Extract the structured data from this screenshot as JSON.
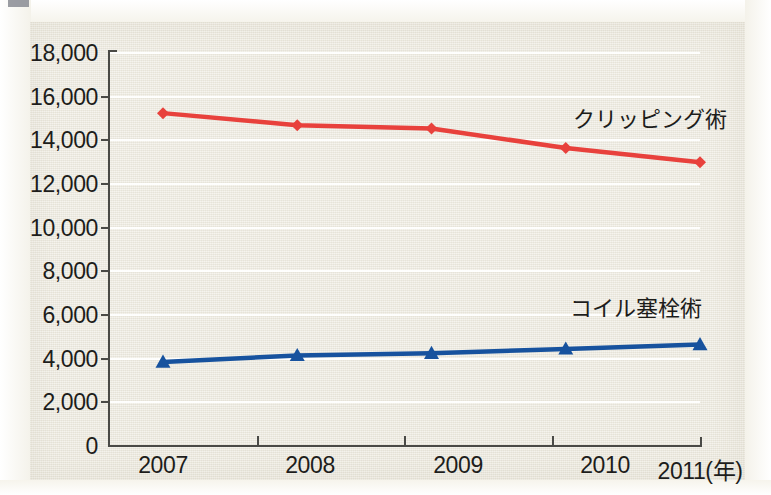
{
  "chart_data": {
    "type": "line",
    "title": "",
    "xlabel": "年",
    "ylabel": "",
    "x": [
      2007,
      2008,
      2009,
      2010,
      2011
    ],
    "categories": [
      "2007",
      "2008",
      "2009",
      "2010",
      "2011"
    ],
    "xtick_labels": [
      "2007",
      "2008",
      "2009",
      "2010",
      "2011(年)"
    ],
    "ytick_labels": [
      "18,000",
      "16,000",
      "14,000",
      "12,000",
      "10,000",
      "8,000",
      "6,000",
      "4,000",
      "2,000",
      "0"
    ],
    "ytick_values": [
      18000,
      16000,
      14000,
      12000,
      10000,
      8000,
      6000,
      4000,
      2000,
      0
    ],
    "ylim": [
      0,
      18000
    ],
    "xlim": [
      2007,
      2011
    ],
    "grid": true,
    "legend_position": "inline-annotation",
    "series": [
      {
        "name": "クリッピング術",
        "color": "#e8413c",
        "marker": "diamond",
        "values": [
          15200,
          14650,
          14500,
          13600,
          12950
        ],
        "label_text": "クリッピング術"
      },
      {
        "name": "コイル塞栓術",
        "color": "#17529e",
        "marker": "triangle",
        "values": [
          3800,
          4100,
          4200,
          4400,
          4600
        ],
        "label_text": "コイル塞栓術"
      }
    ]
  },
  "annotations": {
    "clipping_label": "クリッピング術",
    "coil_label": "コイル塞栓術"
  },
  "axis": {
    "y_labels": [
      "18,000",
      "16,000",
      "14,000",
      "12,000",
      "10,000",
      "8,000",
      "6,000",
      "4,000",
      "2,000",
      "0"
    ],
    "x_labels": [
      "2007",
      "2008",
      "2009",
      "2010",
      "2011(年)"
    ]
  },
  "colors": {
    "clipping_red": "#e8413c",
    "coil_blue": "#17529e",
    "panel_background": "#edeade",
    "gridline": "#ffffff",
    "axis": "#4a4a46",
    "text": "#1d1d1b"
  }
}
